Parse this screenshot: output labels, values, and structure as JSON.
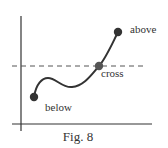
{
  "figure": {
    "caption": "Fig. 8",
    "labels": {
      "above": "above",
      "cross": "cross",
      "below": "below"
    },
    "colors": {
      "axis": "#333333",
      "curve": "#333333",
      "dashed_line": "#555555",
      "point": "#333333",
      "text": "#333333",
      "background": "#ffffff"
    }
  }
}
